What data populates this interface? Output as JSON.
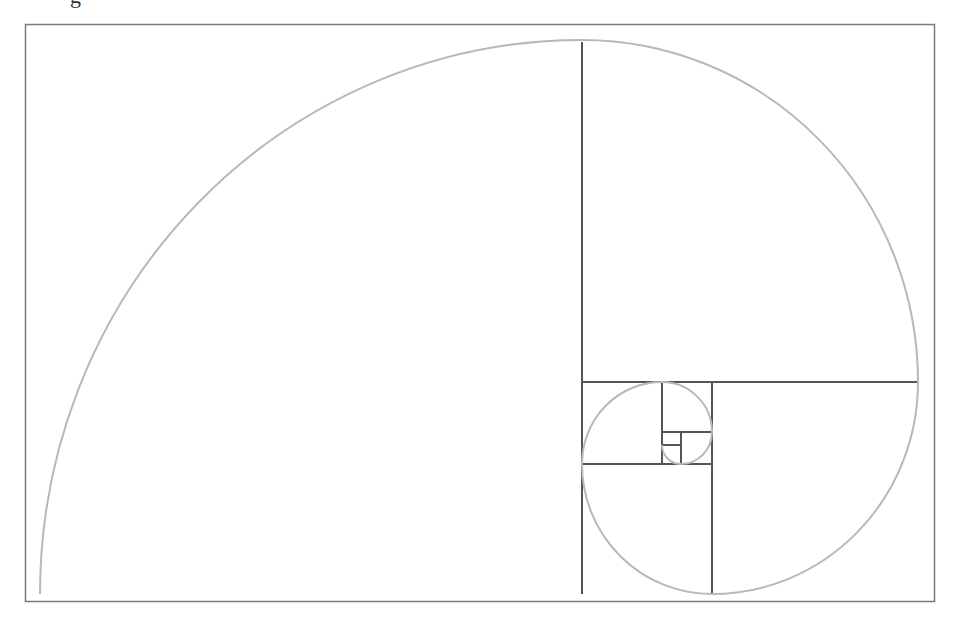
{
  "diagram": {
    "type": "golden-spiral",
    "clipped_heading_fragment": "g",
    "colors": {
      "background": "#ffffff",
      "frame": "#7a7a7a",
      "square_lines": "#555555",
      "spiral": "#b8b8b8"
    },
    "frame": {
      "x": 25,
      "y": 24,
      "width": 909,
      "height": 577
    },
    "squares": [
      {
        "name": "square-1",
        "x": 40,
        "y": 40,
        "w": 542,
        "h": 554
      },
      {
        "name": "square-2",
        "x": 582,
        "y": 40,
        "w": 336,
        "h": 342
      },
      {
        "name": "square-3",
        "x": 712,
        "y": 382,
        "w": 206,
        "h": 212
      },
      {
        "name": "square-4",
        "x": 582,
        "y": 464,
        "w": 130,
        "h": 130
      },
      {
        "name": "square-5",
        "x": 582,
        "y": 382,
        "w": 80,
        "h": 82
      },
      {
        "name": "square-6",
        "x": 662,
        "y": 382,
        "w": 50,
        "h": 50
      },
      {
        "name": "square-7",
        "x": 681,
        "y": 432,
        "w": 31,
        "h": 32
      },
      {
        "name": "square-8",
        "x": 662,
        "y": 445,
        "w": 19,
        "h": 19
      }
    ]
  }
}
